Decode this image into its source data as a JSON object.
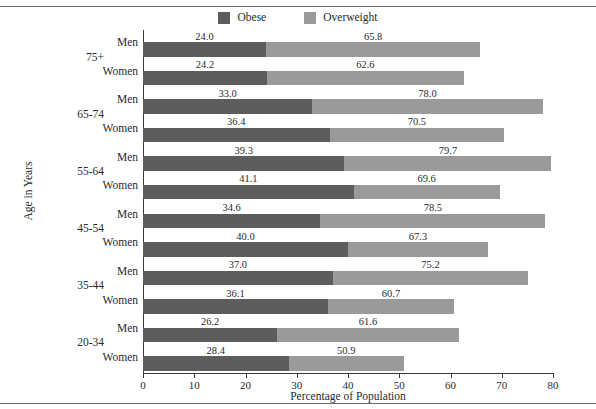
{
  "chart_data": {
    "type": "bar",
    "orientation": "horizontal",
    "stacked": true,
    "title": "",
    "xlabel": "Percentage of Population",
    "ylabel": "Age in Years",
    "xlim": [
      0,
      80
    ],
    "xticks": [
      0,
      10,
      20,
      30,
      40,
      50,
      60,
      70,
      80
    ],
    "grid": false,
    "legend_position": "top-center",
    "legend": [
      "Obese",
      "Overweight"
    ],
    "colors": {
      "obese": "#5d5d5d",
      "overweight": "#9a9a9a",
      "axis": "#3a3a3a",
      "text": "#2a2a2a",
      "rule": "#6e6e6e",
      "background": "#ffffff"
    },
    "series": [
      {
        "name": "Obese",
        "key": "obese"
      },
      {
        "name": "Overweight",
        "key": "overweight"
      }
    ],
    "age_groups": [
      "75+",
      "65-74",
      "55-64",
      "45-54",
      "35-44",
      "20-34"
    ],
    "sexes": [
      "Men",
      "Women"
    ],
    "rows": [
      {
        "age": "75+",
        "sex": "Men",
        "obese": 24.0,
        "overweight": 65.8,
        "obese_label": "24.0",
        "overweight_label": "65.8"
      },
      {
        "age": "75+",
        "sex": "Women",
        "obese": 24.2,
        "overweight": 62.6,
        "obese_label": "24.2",
        "overweight_label": "62.6"
      },
      {
        "age": "65-74",
        "sex": "Men",
        "obese": 33.0,
        "overweight": 78.0,
        "obese_label": "33.0",
        "overweight_label": "78.0"
      },
      {
        "age": "65-74",
        "sex": "Women",
        "obese": 36.4,
        "overweight": 70.5,
        "obese_label": "36.4",
        "overweight_label": "70.5"
      },
      {
        "age": "55-64",
        "sex": "Men",
        "obese": 39.3,
        "overweight": 79.7,
        "obese_label": "39.3",
        "overweight_label": "79.7"
      },
      {
        "age": "55-64",
        "sex": "Women",
        "obese": 41.1,
        "overweight": 69.6,
        "obese_label": "41.1",
        "overweight_label": "69.6"
      },
      {
        "age": "45-54",
        "sex": "Men",
        "obese": 34.6,
        "overweight": 78.5,
        "obese_label": "34.6",
        "overweight_label": "78.5"
      },
      {
        "age": "45-54",
        "sex": "Women",
        "obese": 40.0,
        "overweight": 67.3,
        "obese_label": "40.0",
        "overweight_label": "67.3"
      },
      {
        "age": "35-44",
        "sex": "Men",
        "obese": 37.0,
        "overweight": 75.2,
        "obese_label": "37.0",
        "overweight_label": "75.2"
      },
      {
        "age": "35-44",
        "sex": "Women",
        "obese": 36.1,
        "overweight": 60.7,
        "obese_label": "36.1",
        "overweight_label": "60.7"
      },
      {
        "age": "20-34",
        "sex": "Men",
        "obese": 26.2,
        "overweight": 61.6,
        "obese_label": "26.2",
        "overweight_label": "61.6"
      },
      {
        "age": "20-34",
        "sex": "Women",
        "obese": 28.4,
        "overweight": 50.9,
        "obese_label": "28.4",
        "overweight_label": "50.9"
      }
    ]
  },
  "legend": {
    "entries": [
      {
        "label": "Obese",
        "color": "#5d5d5d"
      },
      {
        "label": "Overweight",
        "color": "#9a9a9a"
      }
    ]
  },
  "axes": {
    "x_title": "Percentage of Population",
    "y_title": "Age in Years",
    "x_tick_labels": [
      "0",
      "10",
      "20",
      "30",
      "40",
      "50",
      "60",
      "70",
      "80"
    ]
  }
}
